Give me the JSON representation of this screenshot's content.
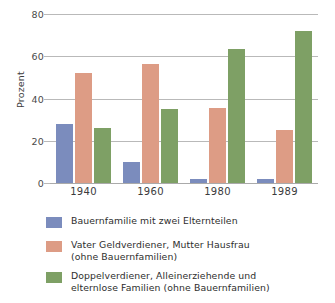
{
  "chart_data": {
    "type": "bar",
    "title": "",
    "subtitle": "",
    "xlabel": "",
    "ylabel": "Prozent",
    "categories": [
      "1940",
      "1960",
      "1980",
      "1989"
    ],
    "yticks": [
      "0",
      "20",
      "40",
      "60",
      "80"
    ],
    "ylim": [
      0,
      80
    ],
    "grid": true,
    "legend_position": "bottom-left",
    "series": [
      {
        "name": "Bauernfamilie mit zwei Elternteilen",
        "color": "#7b8cbd",
        "values": [
          28,
          10,
          2,
          2
        ]
      },
      {
        "name": "Vater Geldverdiener, Mutter Hausfrau\n(ohne Bauernfamilien)",
        "color": "#dd9c85",
        "values": [
          52,
          56.5,
          35.5,
          25
        ]
      },
      {
        "name": "Doppelverdiener, Alleinerziehende und\nelternlose Familien (ohne Bauernfamilien)",
        "color": "#7ea065",
        "values": [
          26,
          35,
          63.5,
          72
        ]
      }
    ]
  },
  "axis": {
    "y_title": "Prozent"
  },
  "colors": {
    "background": "#ffffff",
    "gridline": "#b9b9b9",
    "axis_text": "#3b3b3b",
    "series_blue": "#7b8cbd",
    "series_salmon": "#dd9c85",
    "series_green": "#7ea065"
  }
}
